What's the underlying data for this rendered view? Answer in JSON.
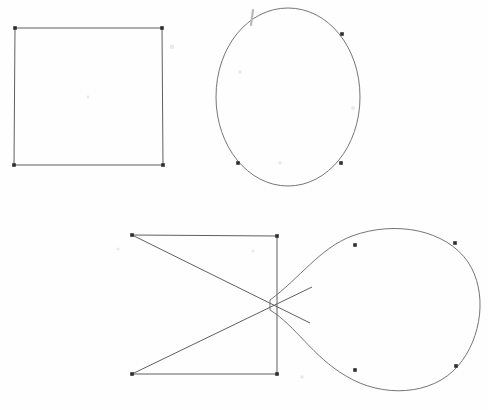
{
  "figure": {
    "canvas": {
      "width": 488,
      "height": 410
    },
    "background_color": "#fefefe",
    "stroke_color": "#5f5f5f",
    "marker_color": "#2e2e2e",
    "stroke_width": 1,
    "marker_radius": 1.8
  },
  "shapes": [
    {
      "id": "shape-square",
      "name": "square",
      "type": "polygon",
      "label": "Square",
      "closed": true,
      "vertices": [
        {
          "x": 15,
          "y": 28
        },
        {
          "x": 162,
          "y": 28
        },
        {
          "x": 163,
          "y": 165
        },
        {
          "x": 14,
          "y": 165
        }
      ],
      "segments": [
        {
          "from": 0,
          "to": 1,
          "kind": "line"
        },
        {
          "from": 1,
          "to": 2,
          "kind": "line"
        },
        {
          "from": 2,
          "to": 3,
          "kind": "line"
        },
        {
          "from": 3,
          "to": 0,
          "kind": "line"
        }
      ],
      "path": "M 15 28 L 162 28 L 163 165 L 14 165 Z",
      "markers": [
        {
          "x": 15,
          "y": 28
        },
        {
          "x": 162,
          "y": 28
        },
        {
          "x": 163,
          "y": 165
        },
        {
          "x": 14,
          "y": 165
        }
      ]
    },
    {
      "id": "shape-ellipse",
      "name": "ellipse",
      "type": "closed-curve",
      "label": "Ellipse",
      "closed": true,
      "center": {
        "x": 288,
        "y": 97
      },
      "radius_x": 72,
      "radius_y": 89,
      "bounds": {
        "x_min": 216,
        "x_max": 360,
        "y_min": 8,
        "y_max": 186
      },
      "path": "M 288 8 C 328 8 360 47 360 97 C 360 146 328 186 288 186 C 248 186 216 146 216 97 C 216 47 248 8 288 8 Z",
      "markers": [
        {
          "x": 342,
          "y": 34
        },
        {
          "x": 238,
          "y": 163
        },
        {
          "x": 341,
          "y": 163
        }
      ],
      "smudges": [
        {
          "x1": 253,
          "y1": 10,
          "x2": 251,
          "y2": 25
        }
      ]
    },
    {
      "id": "shape-bowtie",
      "name": "crossed-quadrilateral",
      "type": "polygon-with-diagonals",
      "label": "Crossed quadrilateral (bowtie)",
      "closed": false,
      "vertices": [
        {
          "x": 132,
          "y": 235
        },
        {
          "x": 277,
          "y": 236
        },
        {
          "x": 277,
          "y": 374
        },
        {
          "x": 132,
          "y": 374
        }
      ],
      "segments": [
        {
          "from": 0,
          "to": 1,
          "kind": "line",
          "name": "top-edge"
        },
        {
          "from": 1,
          "to": 2,
          "kind": "line",
          "name": "right-edge"
        },
        {
          "from": 2,
          "to": 3,
          "kind": "line",
          "name": "bottom-edge"
        },
        {
          "from": 0,
          "to": 2,
          "kind": "line",
          "name": "diagonal-down"
        },
        {
          "from": 3,
          "to": 1,
          "kind": "line",
          "name": "diagonal-up"
        }
      ],
      "path": "M 132 235 L 277 236 L 277 374 L 132 374",
      "diagonals": [
        "M 132 235 L 310 323",
        "M 132 374 L 312 287"
      ],
      "markers": [
        {
          "x": 132,
          "y": 235
        },
        {
          "x": 277,
          "y": 236
        },
        {
          "x": 277,
          "y": 374
        },
        {
          "x": 132,
          "y": 374
        }
      ],
      "crossing_point": {
        "x": 272,
        "y": 305
      }
    },
    {
      "id": "shape-teardrop",
      "name": "teardrop-loop",
      "type": "closed-curve",
      "label": "Teardrop / balloon loop",
      "closed": true,
      "cusp": {
        "x": 270,
        "y": 305
      },
      "bounds": {
        "x_min": 270,
        "x_max": 478,
        "y_min": 222,
        "y_max": 392
      },
      "path": "M 270 300 C 300 278 320 248 352 236 C 396 220 446 230 468 262 C 488 292 482 338 458 366 C 432 396 382 398 346 376 C 312 356 296 326 270 310 Z",
      "markers": [
        {
          "x": 355,
          "y": 245
        },
        {
          "x": 455,
          "y": 243
        },
        {
          "x": 355,
          "y": 370
        },
        {
          "x": 456,
          "y": 366
        }
      ]
    }
  ],
  "specks": [
    {
      "x": 172,
      "y": 47,
      "r": 2.2
    },
    {
      "x": 240,
      "y": 72,
      "r": 1.8
    },
    {
      "x": 353,
      "y": 108,
      "r": 2.0
    },
    {
      "x": 280,
      "y": 163,
      "r": 1.8
    },
    {
      "x": 118,
      "y": 249,
      "r": 1.6
    },
    {
      "x": 253,
      "y": 251,
      "r": 1.6
    },
    {
      "x": 302,
      "y": 377,
      "r": 1.8
    },
    {
      "x": 88,
      "y": 97,
      "r": 1.4
    }
  ]
}
